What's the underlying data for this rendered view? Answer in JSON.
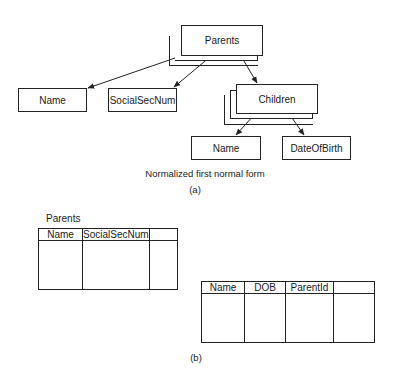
{
  "diagram_a": {
    "root": {
      "label": "Parents"
    },
    "parent_attributes": [
      {
        "label": "Name"
      },
      {
        "label": "SocialSecNum"
      }
    ],
    "child_group": {
      "label": "Children"
    },
    "child_attributes": [
      {
        "label": "Name"
      },
      {
        "label": "DateOfBirth"
      }
    ],
    "caption": "Normalized first normal form",
    "sublabel": "(a)"
  },
  "diagram_b": {
    "parents_table": {
      "title": "Parents",
      "columns": [
        "Name",
        "SocialSecNum",
        ""
      ]
    },
    "children_table": {
      "columns": [
        "Name",
        "DOB",
        "ParentId",
        ""
      ]
    },
    "sublabel": "(b)"
  },
  "colors": {
    "line": "#222222",
    "background": "#ffffff",
    "text": "#1a1a1a"
  }
}
